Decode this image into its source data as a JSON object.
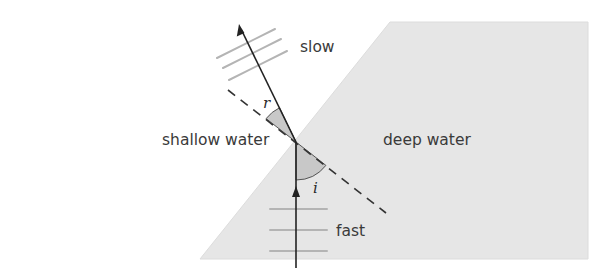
{
  "diagram": {
    "regions": {
      "shallow": {
        "label": "shallow water",
        "fill": "#ffffff"
      },
      "deep": {
        "label": "deep water",
        "fill": "#e6e6e6"
      }
    },
    "speeds": {
      "upper": "slow",
      "lower": "fast"
    },
    "angles": {
      "incidence": {
        "symbol": "i",
        "fill": "#c8c8c8"
      },
      "refraction": {
        "symbol": "r",
        "fill": "#c8c8c8"
      }
    },
    "colors": {
      "ray": "#222222",
      "wavefront": "#b4b4b4",
      "normal": "#333333",
      "boundary": "#d0d0d0",
      "angle_outline": "#555555"
    }
  }
}
